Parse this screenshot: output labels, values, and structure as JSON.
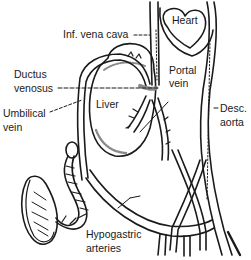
{
  "diagram": {
    "colors": {
      "ink": "#1a1a1a",
      "background": "#ffffff",
      "shade": "#8a8a8a"
    },
    "labels": {
      "heart": "Heart",
      "inf_vena_cava": "Inf. vena cava",
      "ductus_line1": "Ductus",
      "ductus_line2": "venosus",
      "liver": "Liver",
      "portal_line1": "Portal",
      "portal_line2": "vein",
      "umbilical_line1": "Umbilical",
      "umbilical_line2": "vein",
      "desc_line1": "Desc.",
      "desc_line2": "aorta",
      "hypo_line1": "Hypogastric",
      "hypo_line2": "arteries"
    }
  }
}
